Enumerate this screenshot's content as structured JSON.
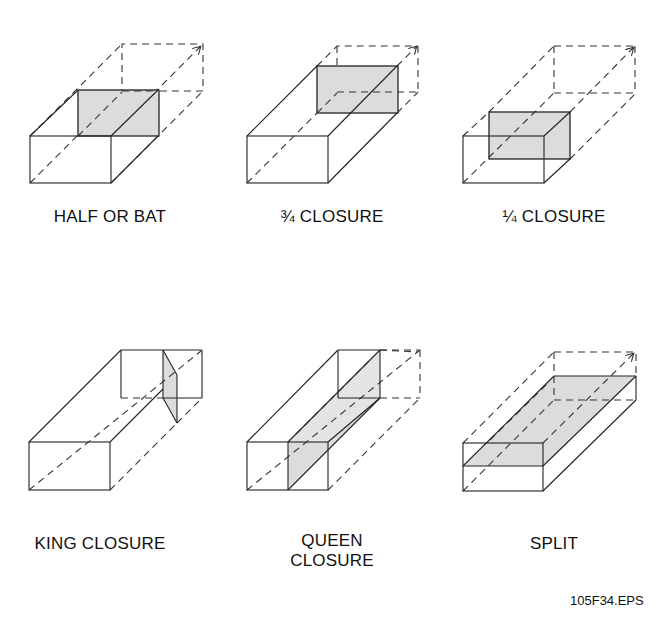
{
  "figure": {
    "panels": [
      {
        "id": "half-or-bat",
        "label": "HALF OR BAT"
      },
      {
        "id": "three-quarter-closure",
        "label": "¾ CLOSURE"
      },
      {
        "id": "quarter-closure",
        "label": "¼ CLOSURE"
      },
      {
        "id": "king-closure",
        "label": "KING CLOSURE"
      },
      {
        "id": "queen-closure",
        "label_line1": "QUEEN",
        "label_line2": "CLOSURE"
      },
      {
        "id": "split",
        "label": "SPLIT"
      }
    ],
    "file_code": "105F34.EPS",
    "colors": {
      "line": "#222222",
      "shade": "#dcdcdc",
      "background": "#ffffff"
    }
  }
}
